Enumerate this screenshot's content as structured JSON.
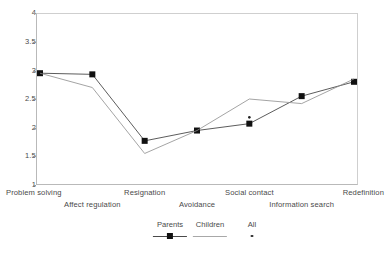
{
  "chart_data": {
    "type": "line",
    "title": "",
    "subtitle": "",
    "xlabel": "",
    "ylabel": "",
    "ylim": [
      1,
      4
    ],
    "yticks": [
      1,
      1.5,
      2,
      2.5,
      3,
      3.5,
      4
    ],
    "ytick_labels": [
      "1",
      "1.5",
      "2",
      "2.5",
      "3",
      "3.5",
      "4"
    ],
    "grid": false,
    "legend_position": "bottom-center",
    "categories": [
      "Problem solving",
      "Affect regulation",
      "Resignation",
      "Avoidance",
      "Social contact",
      "Information search",
      "Redefinition"
    ],
    "series": [
      {
        "name": "Parents",
        "marker": "filled-square",
        "values": [
          2.95,
          2.93,
          1.77,
          1.95,
          2.07,
          2.55,
          2.8
        ]
      },
      {
        "name": "Children",
        "marker": "line-only",
        "values": [
          2.95,
          2.7,
          1.55,
          1.95,
          2.5,
          2.42,
          2.85
        ]
      },
      {
        "name": "All",
        "marker": "small-dot",
        "values": [
          null,
          null,
          null,
          null,
          2.18,
          null,
          null
        ]
      }
    ]
  },
  "legend": {
    "items": [
      {
        "label": "Parents",
        "key": "filled-square-with-line"
      },
      {
        "label": "Children",
        "key": "plain-line"
      },
      {
        "label": "All",
        "key": "small-dot"
      }
    ]
  },
  "caption": {
    "text": ""
  }
}
